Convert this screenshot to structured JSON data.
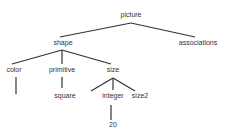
{
  "diagram": {
    "type": "tree",
    "line_color": "#333333",
    "nodes": [
      {
        "id": "picture",
        "label": "picture",
        "x": 131,
        "y": 14
      },
      {
        "id": "shape",
        "label": "shape",
        "x": 63,
        "y": 42
      },
      {
        "id": "associations",
        "label": "associations",
        "x": 198,
        "y": 42
      },
      {
        "id": "color",
        "label": "color",
        "x": 14,
        "y": 69
      },
      {
        "id": "primitive",
        "label": "primitive",
        "x": 62,
        "y": 69
      },
      {
        "id": "size",
        "label": "size",
        "x": 113,
        "y": 69
      },
      {
        "id": "square",
        "label": "square",
        "x": 65,
        "y": 95
      },
      {
        "id": "integer",
        "label": "integer",
        "x": 113,
        "y": 95
      },
      {
        "id": "size2",
        "label": "size2",
        "x": 140,
        "y": 95
      },
      {
        "id": "twenty",
        "label": "20",
        "x": 113,
        "y": 124
      }
    ],
    "edges": [
      {
        "from": "picture",
        "to": "shape",
        "x1": 131,
        "y1": 23,
        "x2": 60,
        "y2": 37
      },
      {
        "from": "picture",
        "to": "associations",
        "x1": 131,
        "y1": 23,
        "x2": 195,
        "y2": 37
      },
      {
        "from": "shape",
        "to": "color",
        "x1": 62,
        "y1": 50,
        "x2": 12,
        "y2": 64
      },
      {
        "from": "shape",
        "to": "primitive",
        "x1": 62,
        "y1": 50,
        "x2": 62,
        "y2": 64
      },
      {
        "from": "shape",
        "to": "size",
        "x1": 62,
        "y1": 50,
        "x2": 111,
        "y2": 64
      },
      {
        "from": "color",
        "to": "",
        "x1": 16,
        "y1": 77,
        "x2": 16,
        "y2": 94
      },
      {
        "from": "primitive",
        "to": "square",
        "x1": 62,
        "y1": 77,
        "x2": 62,
        "y2": 88
      },
      {
        "from": "size",
        "to": "",
        "x1": 113,
        "y1": 78,
        "x2": 91,
        "y2": 91
      },
      {
        "from": "size",
        "to": "integer",
        "x1": 113,
        "y1": 78,
        "x2": 113,
        "y2": 90
      },
      {
        "from": "size",
        "to": "size2",
        "x1": 113,
        "y1": 78,
        "x2": 135,
        "y2": 91
      },
      {
        "from": "integer",
        "to": "twenty",
        "x1": 111,
        "y1": 105,
        "x2": 111,
        "y2": 120
      }
    ]
  }
}
